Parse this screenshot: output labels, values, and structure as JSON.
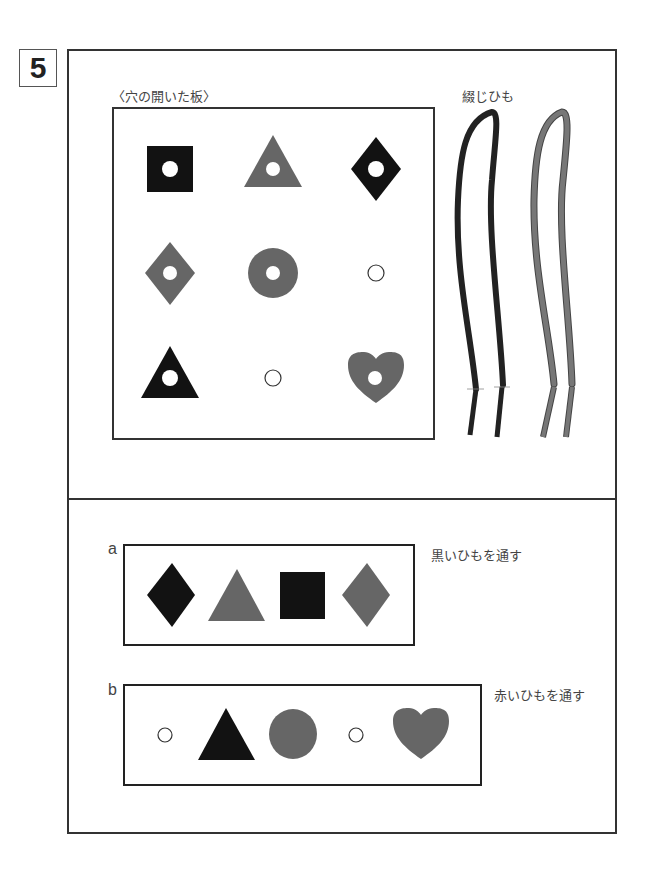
{
  "problem_number": "5",
  "top": {
    "board_label": "〈穴の開いた板〉",
    "laces_label": "綴じひも",
    "board_grid": [
      [
        {
          "shape": "square",
          "color": "black",
          "hole": true
        },
        {
          "shape": "triangle",
          "color": "gray",
          "hole": true
        },
        {
          "shape": "diamond",
          "color": "black",
          "hole": true
        }
      ],
      [
        {
          "shape": "diamond",
          "color": "gray",
          "hole": true
        },
        {
          "shape": "circle",
          "color": "gray",
          "hole": true
        },
        {
          "shape": "empty-hole",
          "hole": true
        }
      ],
      [
        {
          "shape": "triangle",
          "color": "black",
          "hole": true
        },
        {
          "shape": "empty-hole",
          "hole": true
        },
        {
          "shape": "heart",
          "color": "gray",
          "hole": true
        }
      ]
    ],
    "laces": [
      {
        "color": "black"
      },
      {
        "color": "red (gray)"
      }
    ]
  },
  "bottom": {
    "options": [
      {
        "letter": "a",
        "instruction": "黒いひもを通す",
        "items": [
          "diamond-black",
          "triangle-gray",
          "square-black",
          "diamond-gray"
        ]
      },
      {
        "letter": "b",
        "instruction": "赤いひもを通す",
        "items": [
          "empty-hole",
          "triangle-black",
          "circle-gray",
          "empty-hole",
          "heart-gray"
        ]
      }
    ]
  },
  "colors": {
    "black": "#121212",
    "gray": "#666666",
    "line": "#333333"
  }
}
